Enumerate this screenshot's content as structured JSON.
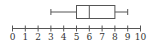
{
  "chart_data": {
    "type": "boxplot",
    "title": "",
    "xlabel": "",
    "ylabel": "",
    "orientation": "horizontal",
    "xlim": [
      0,
      10
    ],
    "tick_labels": [
      "0",
      "1",
      "2",
      "3",
      "4",
      "5",
      "6",
      "7",
      "8",
      "9",
      "10"
    ],
    "grid": false,
    "legend": null,
    "series": [
      {
        "name": "",
        "min": 3,
        "q1": 5,
        "median": 6,
        "q3": 8,
        "max": 9
      }
    ]
  },
  "colors": {
    "stroke": "#555555",
    "text": "#333333",
    "background": "#ffffff"
  }
}
